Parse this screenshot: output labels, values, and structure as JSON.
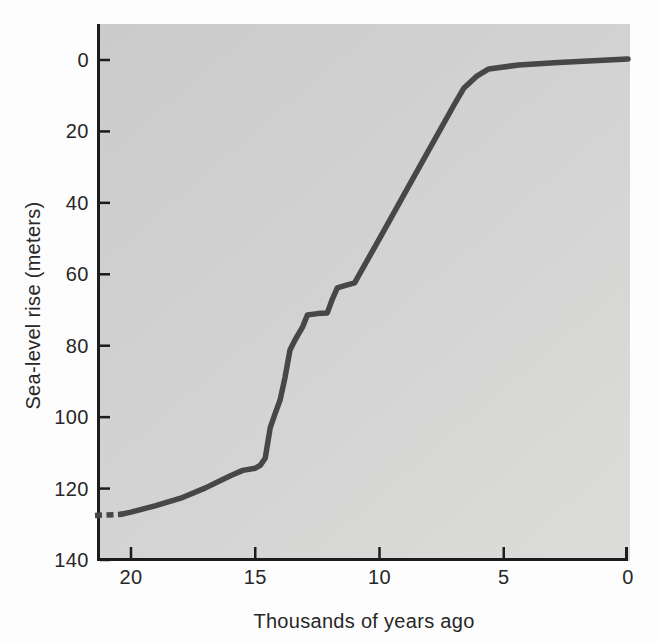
{
  "chart_data": {
    "type": "line",
    "title": "",
    "xlabel": "Thousands of years ago",
    "ylabel": "Sea-level rise (meters)",
    "x_axis": {
      "ticks": [
        20,
        15,
        10,
        5,
        0
      ],
      "range": [
        21.5,
        0
      ],
      "direction": "reversed-left-to-right",
      "grid": false
    },
    "y_axis": {
      "ticks": [
        0,
        20,
        40,
        60,
        80,
        100,
        120,
        140
      ],
      "range": [
        0,
        140
      ],
      "direction": "inverted-zero-at-top",
      "grid": false
    },
    "series": [
      {
        "name": "sea-level-curve",
        "style": "solid",
        "x": [
          20.4,
          20.0,
          19.0,
          18.0,
          17.0,
          16.0,
          15.5,
          15.0,
          14.8,
          14.6,
          14.4,
          14.2,
          14.0,
          13.8,
          13.6,
          13.4,
          13.1,
          12.9,
          12.5,
          12.1,
          11.9,
          11.7,
          11.4,
          11.0,
          10.0,
          9.0,
          8.0,
          7.0,
          6.6,
          6.1,
          5.6,
          4.4,
          2.8,
          1.2,
          0.0
        ],
        "y": [
          127.2,
          126.6,
          124.8,
          122.7,
          119.8,
          116.4,
          114.9,
          114.3,
          113.5,
          111.5,
          103.0,
          99.0,
          95.2,
          88.8,
          81.2,
          78.4,
          74.8,
          71.4,
          71.0,
          70.8,
          67.0,
          63.8,
          63.2,
          62.4,
          50.0,
          37.5,
          25.0,
          12.6,
          7.8,
          4.6,
          2.5,
          1.4,
          0.7,
          0.1,
          -0.3
        ]
      },
      {
        "name": "sea-level-curve-dashed-start",
        "style": "dashed",
        "x": [
          21.45,
          20.35
        ],
        "y": [
          127.5,
          127.2
        ]
      }
    ],
    "colors": {
      "curve": "#47474a",
      "axis": "#1c1c1c",
      "tick": "#1c1c1c",
      "label_text": "#272727",
      "plot_bg_top": "#cbcbcc",
      "plot_bg_mid": "#d3d3d3",
      "plot_bg_bottom": "#dbdbd9",
      "page_bg": "#fdfdfd"
    },
    "legend": null
  }
}
